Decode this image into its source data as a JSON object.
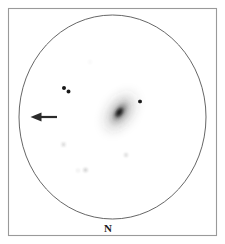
{
  "figure": {
    "type": "astronomical-observation-sketch",
    "medium": "pencil-on-white",
    "frame": {
      "x": 8,
      "y": 8,
      "width": 209,
      "height": 228,
      "stroke": "#9a9a9a",
      "stroke_width": 1.1
    },
    "field_of_view": {
      "shape": "ellipse",
      "cx": 112.5,
      "cy": 117,
      "rx": 93.5,
      "ry": 102,
      "stroke": "#555555",
      "stroke_width": 0.9,
      "fill": "none"
    },
    "orientation_label": {
      "text": "N",
      "x": 108,
      "y": 232,
      "meaning": "north-direction-marker"
    },
    "direction_arrow": {
      "name": "pointer-arrow",
      "points": "west",
      "tail_x": 57,
      "tip_x": 31,
      "y": 117,
      "color": "#2b2b2b"
    },
    "galaxy": {
      "name": "central-galaxy",
      "cx": 120,
      "cy": 112,
      "position_angle_deg": 35,
      "core": {
        "rx": 3.2,
        "ry": 7.0,
        "opacity": 0.92
      },
      "inner_halo": {
        "rx": 7.5,
        "ry": 14.0,
        "opacity": 0.4
      },
      "outer_halo": {
        "rx": 13.0,
        "ry": 22.0,
        "opacity": 0.16
      },
      "faint_halo": {
        "rx": 18.0,
        "ry": 28.0,
        "opacity": 0.07
      },
      "color": "#3a3a3a"
    },
    "stars": [
      {
        "id": "star-1",
        "cx": 64.0,
        "cy": 88.0,
        "r": 1.8,
        "opacity": 0.95,
        "note": "bright-pair-west-member"
      },
      {
        "id": "star-2",
        "cx": 68.5,
        "cy": 91.5,
        "r": 1.9,
        "opacity": 0.95,
        "note": "bright-pair-east-member"
      },
      {
        "id": "star-3",
        "cx": 140.0,
        "cy": 101.5,
        "r": 1.8,
        "opacity": 0.95,
        "note": "star-northeast-of-galaxy"
      },
      {
        "id": "star-4",
        "cx": 63.5,
        "cy": 144.5,
        "r": 1.1,
        "opacity": 0.55,
        "note": "faint-star-southwest"
      },
      {
        "id": "star-5",
        "cx": 126.0,
        "cy": 155.0,
        "r": 1.1,
        "opacity": 0.55,
        "note": "faint-star-south-of-galaxy"
      },
      {
        "id": "star-6",
        "cx": 78.0,
        "cy": 170.5,
        "r": 0.9,
        "opacity": 0.4,
        "note": "faint-star-lower-left"
      },
      {
        "id": "star-7",
        "cx": 85.5,
        "cy": 170.0,
        "r": 1.2,
        "opacity": 0.6,
        "note": "faint-star-lower-middle"
      },
      {
        "id": "star-8",
        "cx": 90.0,
        "cy": 62.0,
        "r": 0.7,
        "opacity": 0.22,
        "note": "very-faint-star-upper-area"
      }
    ],
    "colors": {
      "background": "#ffffff",
      "ink": "#2b2b2b",
      "frame": "#9a9a9a",
      "circle": "#555555"
    }
  }
}
